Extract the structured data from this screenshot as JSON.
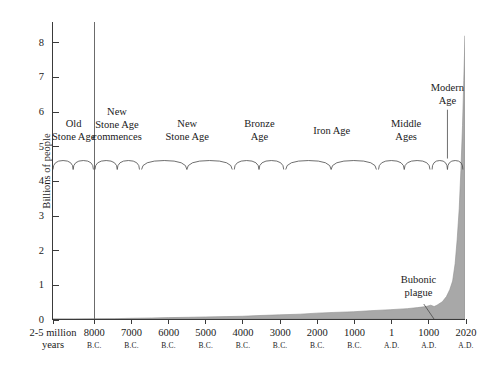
{
  "top_fragment": "",
  "chart_data": {
    "type": "area",
    "title": "",
    "xlabel": "",
    "ylabel": "Billions of people",
    "ylim": [
      0,
      8.6
    ],
    "yticks": [
      0,
      1,
      2,
      3,
      4,
      5,
      6,
      7,
      8
    ],
    "ytick_labels": [
      "0",
      "1",
      "2",
      "3",
      "4",
      "5",
      "6",
      "7",
      "8"
    ],
    "grid": false,
    "legend": "none",
    "fill_color": "#a8a8a8",
    "line_color": "#8f8f8f",
    "axis_color": "#3a3a3a",
    "x_categories": [
      {
        "main": "2-5 million",
        "era": "years",
        "pos": 0.0
      },
      {
        "main": "8000",
        "era": "B.C.",
        "pos": 0.1
      },
      {
        "main": "7000",
        "era": "B.C.",
        "pos": 0.19
      },
      {
        "main": "6000",
        "era": "B.C.",
        "pos": 0.28
      },
      {
        "main": "5000",
        "era": "B.C.",
        "pos": 0.37
      },
      {
        "main": "4000",
        "era": "B.C.",
        "pos": 0.46
      },
      {
        "main": "3000",
        "era": "B.C.",
        "pos": 0.55
      },
      {
        "main": "2000",
        "era": "B.C.",
        "pos": 0.64
      },
      {
        "main": "1000",
        "era": "B.C.",
        "pos": 0.73
      },
      {
        "main": "1",
        "era": "A.D.",
        "pos": 0.82
      },
      {
        "main": "1000",
        "era": "A.D.",
        "pos": 0.91
      },
      {
        "main": "2020",
        "era": "A.D.",
        "pos": 1.0
      }
    ],
    "series": [
      {
        "name": "World population",
        "points": [
          {
            "x": 0.0,
            "y": 0.0
          },
          {
            "x": 0.05,
            "y": 0.0
          },
          {
            "x": 0.1,
            "y": 0.005
          },
          {
            "x": 0.15,
            "y": 0.01
          },
          {
            "x": 0.19,
            "y": 0.02
          },
          {
            "x": 0.24,
            "y": 0.03
          },
          {
            "x": 0.28,
            "y": 0.04
          },
          {
            "x": 0.33,
            "y": 0.05
          },
          {
            "x": 0.37,
            "y": 0.06
          },
          {
            "x": 0.42,
            "y": 0.07
          },
          {
            "x": 0.46,
            "y": 0.08
          },
          {
            "x": 0.5,
            "y": 0.1
          },
          {
            "x": 0.55,
            "y": 0.12
          },
          {
            "x": 0.6,
            "y": 0.14
          },
          {
            "x": 0.64,
            "y": 0.17
          },
          {
            "x": 0.68,
            "y": 0.19
          },
          {
            "x": 0.73,
            "y": 0.21
          },
          {
            "x": 0.77,
            "y": 0.24
          },
          {
            "x": 0.82,
            "y": 0.27
          },
          {
            "x": 0.86,
            "y": 0.3
          },
          {
            "x": 0.885,
            "y": 0.33
          },
          {
            "x": 0.905,
            "y": 0.36
          },
          {
            "x": 0.917,
            "y": 0.4
          },
          {
            "x": 0.925,
            "y": 0.36
          },
          {
            "x": 0.932,
            "y": 0.4
          },
          {
            "x": 0.945,
            "y": 0.5
          },
          {
            "x": 0.955,
            "y": 0.65
          },
          {
            "x": 0.963,
            "y": 0.85
          },
          {
            "x": 0.97,
            "y": 1.1
          },
          {
            "x": 0.976,
            "y": 1.6
          },
          {
            "x": 0.981,
            "y": 2.3
          },
          {
            "x": 0.986,
            "y": 3.2
          },
          {
            "x": 0.99,
            "y": 4.3
          },
          {
            "x": 0.994,
            "y": 5.6
          },
          {
            "x": 0.997,
            "y": 6.9
          },
          {
            "x": 1.0,
            "y": 8.2
          }
        ]
      }
    ],
    "divider_line": {
      "label": "8000 B.C.",
      "pos": 0.1
    },
    "era_labels": [
      {
        "id": "old-stone-age",
        "lines": [
          "Old",
          "Stone Age"
        ],
        "center": 0.05,
        "top": 96,
        "brace": [
          0.0,
          0.098
        ]
      },
      {
        "id": "new-stone-age-commences",
        "lines": [
          "New",
          "Stone Age",
          "commences"
        ],
        "center": 0.155,
        "top": 84,
        "brace": [
          0.102,
          0.21
        ]
      },
      {
        "id": "new-stone-age",
        "lines": [
          "New",
          "Stone Age"
        ],
        "center": 0.325,
        "top": 96,
        "brace": [
          0.215,
          0.435
        ]
      },
      {
        "id": "bronze-age",
        "lines": [
          "Bronze",
          "Age"
        ],
        "center": 0.5,
        "top": 96,
        "brace": [
          0.44,
          0.56
        ]
      },
      {
        "id": "iron-age",
        "lines": [
          "Iron Age"
        ],
        "center": 0.675,
        "top": 103,
        "brace": [
          0.565,
          0.785
        ]
      },
      {
        "id": "middle-ages",
        "lines": [
          "Middle",
          "Ages"
        ],
        "center": 0.855,
        "top": 96,
        "brace": [
          0.79,
          0.915
        ]
      },
      {
        "id": "modern-age",
        "lines": [
          "Modern",
          "Age"
        ],
        "center": 0.955,
        "top": 60,
        "brace": [
          0.92,
          0.995
        ]
      }
    ],
    "annotations": [
      {
        "id": "bubonic-plague",
        "lines": [
          "Bubonic",
          "plague"
        ],
        "center": 0.885,
        "top": 252,
        "leader": {
          "x1": 0.9,
          "y1": 283,
          "x2": 0.928,
          "y2": 300
        }
      }
    ]
  }
}
